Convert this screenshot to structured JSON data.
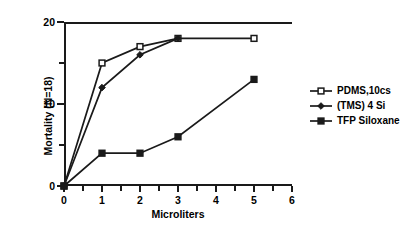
{
  "chart_data": {
    "type": "line",
    "title": "",
    "xlabel": "Microliters",
    "ylabel": "Mortality (N=18)",
    "xlim": [
      0,
      6
    ],
    "ylim": [
      0,
      20
    ],
    "xticks": [
      0,
      1,
      2,
      3,
      4,
      5,
      6
    ],
    "yticks": [
      0,
      10,
      20
    ],
    "yticks_minor": [
      5,
      15
    ],
    "xticks_minor": [
      0.5,
      1.5,
      2.5,
      3.5,
      4.5,
      5.5
    ],
    "grid": false,
    "legend_position": "right-outside",
    "series": [
      {
        "name": "PDMS,10cs",
        "marker": "open-square",
        "x": [
          0,
          1,
          2,
          3,
          5
        ],
        "values": [
          0,
          15,
          17,
          18,
          18
        ]
      },
      {
        "name": "(TMS) 4 Si",
        "marker": "filled-diamond",
        "x": [
          0,
          1,
          2,
          3
        ],
        "values": [
          0,
          12,
          16,
          18
        ]
      },
      {
        "name": "TFP Siloxane",
        "marker": "filled-square",
        "x": [
          0,
          1,
          2,
          3,
          5
        ],
        "values": [
          0,
          4,
          4,
          6,
          13
        ]
      }
    ]
  },
  "axis": {
    "x_title": "Microliters",
    "y_title": "Mortality (N=18)",
    "x_tick_labels": [
      "0",
      "1",
      "2",
      "3",
      "4",
      "5",
      "6"
    ],
    "y_tick_labels": [
      "0",
      "10",
      "20"
    ]
  },
  "legend": {
    "items": [
      {
        "label": "PDMS,10cs",
        "marker": "open-square"
      },
      {
        "label": "(TMS) 4 Si",
        "marker": "filled-diamond"
      },
      {
        "label": "TFP Siloxane",
        "marker": "filled-square"
      }
    ]
  },
  "colors": {
    "line": "#1a1a1a",
    "marker_fill_open": "#ffffff",
    "marker_fill_solid": "#1a1a1a",
    "background": "#ffffff"
  }
}
